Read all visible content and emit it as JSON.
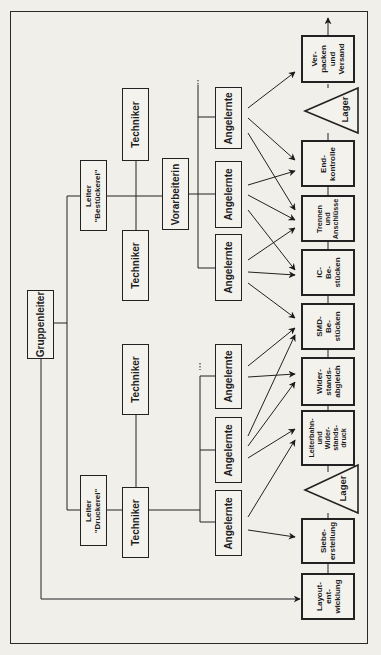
{
  "diagram": {
    "orientation": "rotated-90-counterclockwise",
    "org_chart": {
      "head": "Gruppenleiter",
      "departments": [
        {
          "leader": "Leiter\n\"Bestückerei\"",
          "technicians": [
            "Techniker",
            "Techniker"
          ],
          "supervisor": "Vorarbeiterin",
          "workers": [
            "Angelernte",
            "Angelernte",
            "Angelernte"
          ]
        },
        {
          "leader": "Leiter\n\"Druckerei\"",
          "technicians": [
            "Techniker",
            "Techniker"
          ],
          "workers": [
            "Angelernte",
            "Angelernte",
            "Angelernte"
          ]
        }
      ]
    },
    "process_chain": [
      {
        "label": "Layout-\nent-\nwicklung",
        "type": "process"
      },
      {
        "label": "Siebe-\nerstellung",
        "type": "process"
      },
      {
        "label": "Lager",
        "type": "storage"
      },
      {
        "label": "Leiterbahn-\nund\nWider-\nstands-\ndruck",
        "type": "process"
      },
      {
        "label": "Wider-\nstands-\nabgleich",
        "type": "process"
      },
      {
        "label": "SMD-\nBe-\nstücken",
        "type": "process"
      },
      {
        "label": "IC-\nBe-\nstücken",
        "type": "process"
      },
      {
        "label": "Trennen\nund\nAnschlüsse",
        "type": "process"
      },
      {
        "label": "End-\nkontrolle",
        "type": "process"
      },
      {
        "label": "Lager",
        "type": "storage"
      },
      {
        "label": "Ver-\npacken\nund\nVersand",
        "type": "process"
      }
    ]
  }
}
